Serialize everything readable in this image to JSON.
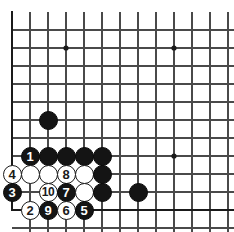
{
  "board": {
    "title": "Go game diagram",
    "size_label": "19x19 corner",
    "line_color": "#4a4a4a",
    "edge_color": "#1a1a1a",
    "black_color": "#141414",
    "white_color": "#ffffff",
    "background_color": "#ffffff",
    "origin_x": 12,
    "origin_y": 12,
    "spacing": 18,
    "cols": 13,
    "rows": 12,
    "stone_radius": 9.5,
    "star_points": [
      {
        "col": 3,
        "row": 2
      },
      {
        "col": 9,
        "row": 2
      },
      {
        "col": 9,
        "row": 8
      }
    ],
    "stones": [
      {
        "col": 2,
        "row": 6,
        "color": "black",
        "label": ""
      },
      {
        "col": 1,
        "row": 8,
        "color": "black",
        "label": "1"
      },
      {
        "col": 2,
        "row": 8,
        "color": "black",
        "label": ""
      },
      {
        "col": 3,
        "row": 8,
        "color": "black",
        "label": ""
      },
      {
        "col": 4,
        "row": 8,
        "color": "black",
        "label": ""
      },
      {
        "col": 5,
        "row": 8,
        "color": "black",
        "label": ""
      },
      {
        "col": 0,
        "row": 9,
        "color": "white",
        "label": "4"
      },
      {
        "col": 1,
        "row": 9,
        "color": "white",
        "label": ""
      },
      {
        "col": 2,
        "row": 9,
        "color": "white",
        "label": ""
      },
      {
        "col": 3,
        "row": 9,
        "color": "white",
        "label": "8"
      },
      {
        "col": 4,
        "row": 9,
        "color": "white",
        "label": ""
      },
      {
        "col": 5,
        "row": 9,
        "color": "black",
        "label": ""
      },
      {
        "col": 0,
        "row": 10,
        "color": "black",
        "label": "3"
      },
      {
        "col": 2,
        "row": 10,
        "color": "white",
        "label": "10"
      },
      {
        "col": 3,
        "row": 10,
        "color": "black",
        "label": "7"
      },
      {
        "col": 4,
        "row": 10,
        "color": "white",
        "label": ""
      },
      {
        "col": 5,
        "row": 10,
        "color": "black",
        "label": ""
      },
      {
        "col": 7,
        "row": 10,
        "color": "black",
        "label": ""
      },
      {
        "col": 1,
        "row": 11,
        "color": "white",
        "label": "2"
      },
      {
        "col": 2,
        "row": 11,
        "color": "black",
        "label": "9"
      },
      {
        "col": 3,
        "row": 11,
        "color": "white",
        "label": "6"
      },
      {
        "col": 4,
        "row": 11,
        "color": "black",
        "label": "5"
      }
    ],
    "move_sequence": [
      {
        "number": "1",
        "color": "black"
      },
      {
        "number": "2",
        "color": "white"
      },
      {
        "number": "3",
        "color": "black"
      },
      {
        "number": "4",
        "color": "white"
      },
      {
        "number": "5",
        "color": "black"
      },
      {
        "number": "6",
        "color": "white"
      },
      {
        "number": "7",
        "color": "black"
      },
      {
        "number": "8",
        "color": "white"
      },
      {
        "number": "9",
        "color": "black"
      },
      {
        "number": "10",
        "color": "white"
      }
    ]
  }
}
